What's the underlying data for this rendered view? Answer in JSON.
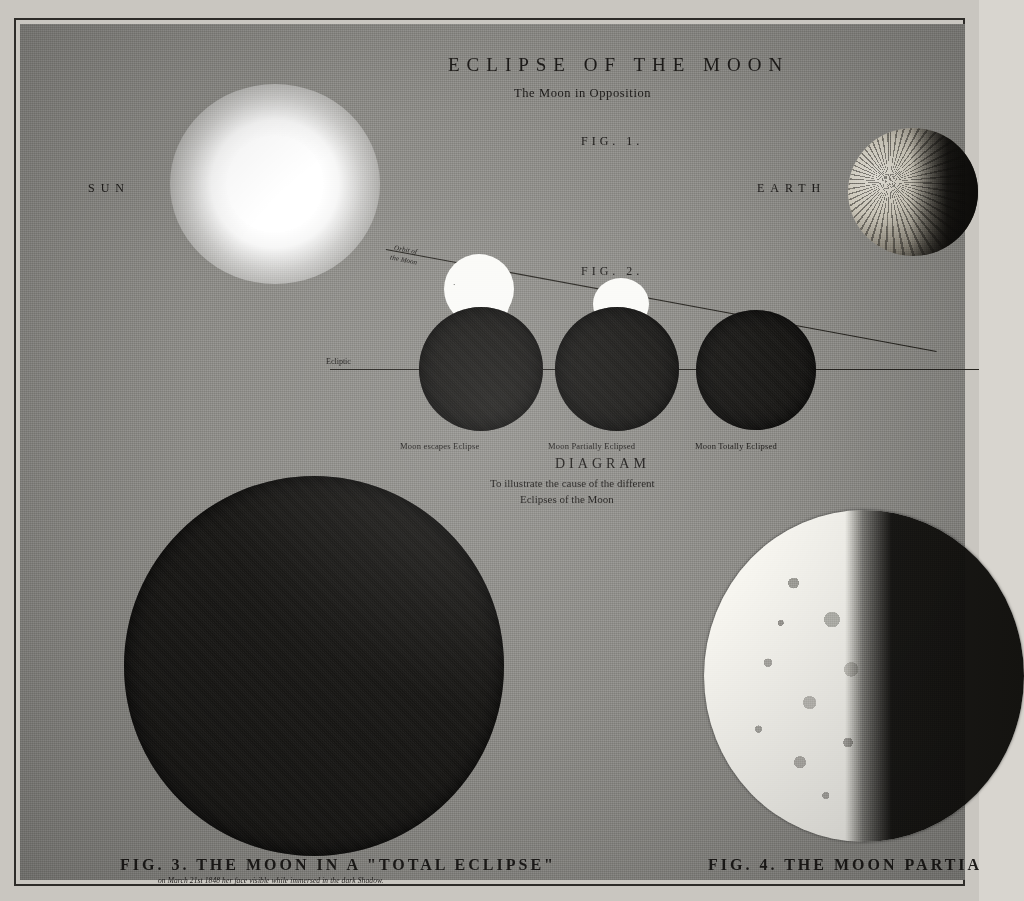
{
  "plate": {
    "title": "ECLIPSE OF THE MOON",
    "subtitle": "The Moon in Opposition",
    "fig1_label": "FIG. 1.",
    "fig2_label": "FIG. 2.",
    "sun_label": "SUN",
    "earth_label": "EARTH",
    "moon_label": "MOON",
    "orbit_label_line1": "Orbit of",
    "orbit_label_line2": "the Moon",
    "ecliptic_label": "Ecliptic"
  },
  "phase_captions": [
    "Moon escapes Eclipse",
    "Moon Partially Eclipsed",
    "Moon Totally Eclipsed"
  ],
  "diagram": {
    "heading": "DIAGRAM",
    "line1": "To illustrate the cause of the different",
    "line2": "Eclipses of the Moon"
  },
  "bottom": {
    "fig3_caption": "FIG. 3. THE MOON IN A \"TOTAL ECLIPSE\"",
    "fig3_note": "on March 21st 1848  her face visible while immersed in the dark Shadow.",
    "fig4_caption": "FIG. 4. THE MOON PARTIA"
  },
  "colors": {
    "paper": "#8e8d89",
    "ink": "#1d1b19",
    "shadow": "#1a1917",
    "highlight": "#fbfbf8"
  }
}
